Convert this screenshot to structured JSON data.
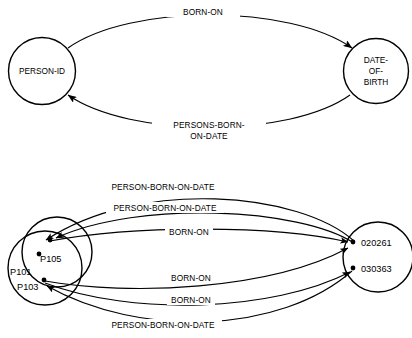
{
  "diagram": {
    "stroke_color": "#000000",
    "background_color": "#ffffff",
    "panels": [
      {
        "id": "type-level",
        "nodes": [
          {
            "id": "person-id",
            "label": "PERSON-ID",
            "label_lines": [
              "PERSON-ID"
            ]
          },
          {
            "id": "date-of-birth",
            "label": "DATE-OF-BIRTH",
            "label_lines": [
              "DATE-",
              "OF-",
              "BIRTH"
            ]
          }
        ],
        "edges": [
          {
            "id": "born-on",
            "label": "BORN-ON",
            "label_lines": [
              "BORN-ON"
            ],
            "from": "person-id",
            "to": "date-of-birth",
            "direction": "right"
          },
          {
            "id": "persons-born-on-date",
            "label": "PERSONS-BORN-ON-DATE",
            "label_lines": [
              "PERSONS-BORN-",
              "ON-DATE"
            ],
            "from": "date-of-birth",
            "to": "person-id",
            "direction": "left"
          }
        ]
      },
      {
        "id": "instance-level",
        "nodes": [
          {
            "id": "person-set",
            "members": [
              "P101",
              "P103",
              "P105"
            ]
          },
          {
            "id": "date-set",
            "members": [
              "020261",
              "030363"
            ]
          }
        ],
        "edges": [
          {
            "id": "e1",
            "label": "PERSON-BORN-ON-DATE",
            "direction": "left"
          },
          {
            "id": "e2",
            "label": "PERSON-BORN-ON-DATE",
            "direction": "left"
          },
          {
            "id": "e3",
            "label": "BORN-ON",
            "direction": "right"
          },
          {
            "id": "e4",
            "label": "BORN-ON",
            "direction": "right"
          },
          {
            "id": "e5",
            "label": "BORN-ON",
            "direction": "right"
          },
          {
            "id": "e6",
            "label": "PERSON-BORN-ON-DATE",
            "direction": "left"
          }
        ]
      }
    ]
  }
}
